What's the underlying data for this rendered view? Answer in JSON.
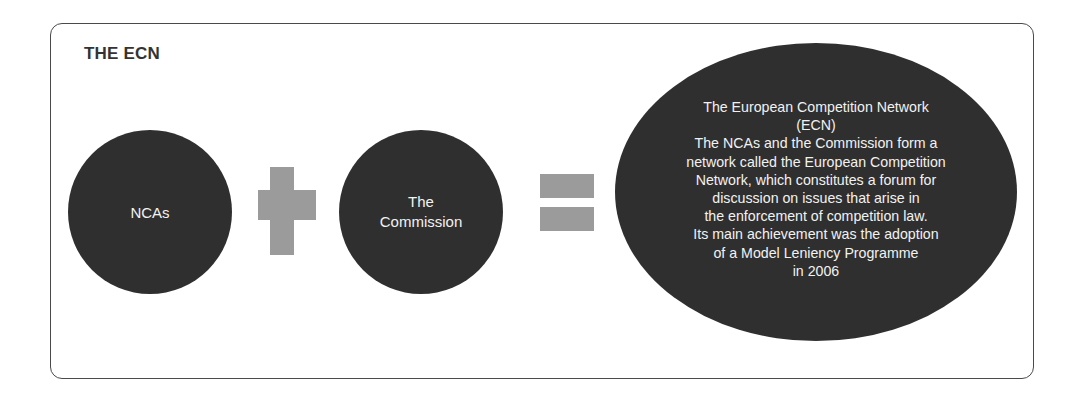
{
  "diagram": {
    "title": "THE ECN",
    "nodes": [
      {
        "id": "ncas",
        "shape": "circle",
        "label": "NCAs"
      },
      {
        "id": "commission",
        "shape": "circle",
        "label": "The\nCommission"
      },
      {
        "id": "ecn",
        "shape": "ellipse",
        "label": "The European Competition Network\n(ECN)\nThe NCAs and the Commission form a\nnetwork called the European Competition\nNetwork, which constitutes a forum for\ndiscussion on issues that arise in\nthe enforcement of competition law.\nIts main achievement was the adoption\nof a Model Leniency Programme\nin 2006"
      }
    ],
    "operators": [
      {
        "symbol": "plus",
        "between": [
          "ncas",
          "commission"
        ]
      },
      {
        "symbol": "equals",
        "between": [
          "commission",
          "ecn"
        ]
      }
    ],
    "colors": {
      "node_fill": "#2f2f2f",
      "node_text": "#f2f2f2",
      "operator_fill": "#9b9b9b",
      "frame_border": "#4a4a4a",
      "title_text": "#333333"
    }
  }
}
